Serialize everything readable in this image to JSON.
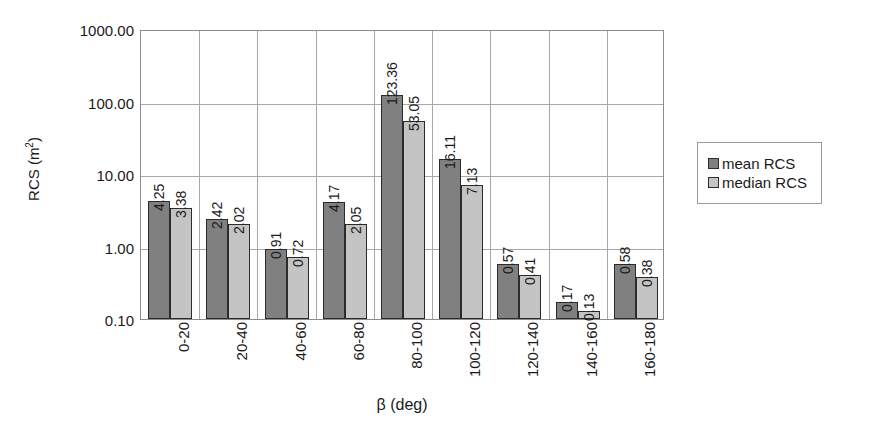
{
  "chart_data": {
    "type": "bar",
    "title": "",
    "xlabel": "β (deg)",
    "ylabel": "RCS (m²)",
    "ylabel_base": "RCS (m",
    "ylabel_sup": "2",
    "ylabel_close": ")",
    "scale": "log",
    "ylim": [
      0.1,
      1000
    ],
    "ytick_labels": [
      "1000.00",
      "100.00",
      "10.00",
      "1.00",
      "0.10"
    ],
    "ytick_values": [
      1000,
      100,
      10,
      1,
      0.1
    ],
    "grid": true,
    "legend_position": "right",
    "categories": [
      "0-20",
      "20-40",
      "40-60",
      "60-80",
      "80-100",
      "100-120",
      "120-140",
      "140-160",
      "160-180"
    ],
    "series": [
      {
        "name": "mean RCS",
        "color": "#808080",
        "values": [
          4.25,
          2.42,
          0.91,
          4.17,
          123.36,
          16.11,
          0.57,
          0.17,
          0.58
        ],
        "labels": [
          "4.25",
          "2.42",
          "0.91",
          "4.17",
          "123.36",
          "16.11",
          "0.57",
          "0.17",
          "0.58"
        ]
      },
      {
        "name": "median RCS",
        "color": "#c4c4c4",
        "values": [
          3.38,
          2.02,
          0.72,
          2.05,
          53.05,
          7.13,
          0.41,
          0.13,
          0.38
        ],
        "labels": [
          "3.38",
          "2.02",
          "0.72",
          "2.05",
          "53.05",
          "7.13",
          "0.41",
          "0.13",
          "0.38"
        ]
      }
    ]
  },
  "legend": {
    "items": [
      {
        "label": "mean RCS",
        "color": "#808080"
      },
      {
        "label": "median RCS",
        "color": "#c4c4c4"
      }
    ]
  },
  "colors": {
    "mean": "#808080",
    "median": "#c4c4c4",
    "axis": "#8c8c8c",
    "grid": "#a8a8a8",
    "text": "#1a1a1a"
  }
}
